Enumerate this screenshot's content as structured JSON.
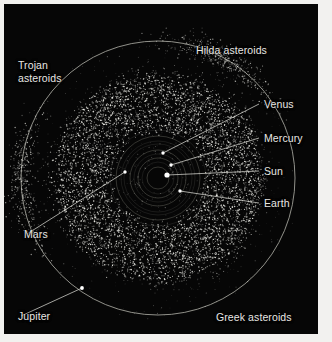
{
  "figure": {
    "background_color": "#060606",
    "frame_color": "#f2f1ef",
    "label_color": "#e8e7e4",
    "orbit_color": "#9a9a92",
    "asteroid_color": "#f0f0ea"
  },
  "labels": {
    "hilda": "Hilda asteroids",
    "trojan": "Trojan\nasteroids",
    "greek": "Greek asteroids",
    "venus": "Venus",
    "mercury": "Mercury",
    "sun": "Sun",
    "earth": "Earth",
    "mars": "Mars",
    "jupiter": "Jupiter"
  },
  "chart_data": {
    "type": "scatter",
    "xlabel": "",
    "ylabel": "",
    "projection": "ecliptic plane, top-down",
    "grid": false,
    "legend": "none",
    "center_px": [
      158,
      178
    ],
    "jupiter_orbit_radius_px": 137,
    "annotations": [
      {
        "name": "Hilda asteroids",
        "x": 196,
        "y": 53,
        "anchor": "start",
        "leader": false
      },
      {
        "name": "Trojan asteroids",
        "x": 18,
        "y": 68,
        "anchor": "start",
        "leader": false
      },
      {
        "name": "Greek asteroids",
        "x": 216,
        "y": 320,
        "anchor": "start",
        "leader": false
      },
      {
        "name": "Venus",
        "x": 264,
        "y": 107,
        "anchor": "start",
        "leader": true,
        "leader_to": [
          163,
          153
        ]
      },
      {
        "name": "Mercury",
        "x": 264,
        "y": 141,
        "anchor": "start",
        "leader": true,
        "leader_to": [
          171,
          165
        ]
      },
      {
        "name": "Sun",
        "x": 264,
        "y": 174,
        "anchor": "start",
        "leader": true,
        "leader_to": [
          167,
          175
        ]
      },
      {
        "name": "Earth",
        "x": 264,
        "y": 206,
        "anchor": "start",
        "leader": true,
        "leader_to": [
          180,
          191
        ]
      },
      {
        "name": "Mars",
        "x": 24,
        "y": 237,
        "anchor": "start",
        "leader": true,
        "leader_to": [
          125,
          172
        ]
      },
      {
        "name": "Jupiter",
        "x": 18,
        "y": 319,
        "anchor": "start",
        "leader": true,
        "leader_to": [
          82,
          288
        ]
      }
    ],
    "orbits": [
      {
        "body": "Mercury",
        "radius_px": 11
      },
      {
        "body": "Venus",
        "radius_px": 20
      },
      {
        "body": "Earth",
        "radius_px": 28
      },
      {
        "body": "Mars",
        "radius_px": 42
      },
      {
        "body": "Jupiter",
        "radius_px": 137
      }
    ],
    "bodies": [
      {
        "name": "Sun",
        "x": 167,
        "y": 175,
        "r": 2.6,
        "color": "#ffffff"
      },
      {
        "name": "Mercury",
        "x": 171,
        "y": 165,
        "r": 1.7,
        "color": "#ffffff"
      },
      {
        "name": "Venus",
        "x": 163,
        "y": 153,
        "r": 1.7,
        "color": "#ffffff"
      },
      {
        "name": "Earth",
        "x": 180,
        "y": 191,
        "r": 1.7,
        "color": "#ffffff"
      },
      {
        "name": "Mars",
        "x": 125,
        "y": 172,
        "r": 1.7,
        "color": "#ffffff"
      },
      {
        "name": "Jupiter",
        "x": 82,
        "y": 288,
        "r": 1.9,
        "color": "#ffffff"
      }
    ],
    "populations": [
      {
        "name": "Main belt",
        "inner_radius_px": 46,
        "outer_radius_px": 104,
        "count": 5200,
        "note": "dense torus between Mars and Jupiter"
      },
      {
        "name": "Hilda asteroids",
        "radius_px": 112,
        "count": 320,
        "note": "triangular 3:2 resonance group"
      },
      {
        "name": "Greek asteroids",
        "radius_px": 137,
        "angle_deg": 300,
        "count": 420,
        "note": "Jupiter L4 Lagrange cluster"
      },
      {
        "name": "Trojan asteroids",
        "radius_px": 137,
        "angle_deg": 180,
        "count": 420,
        "note": "Jupiter L5 Lagrange cluster"
      }
    ]
  }
}
